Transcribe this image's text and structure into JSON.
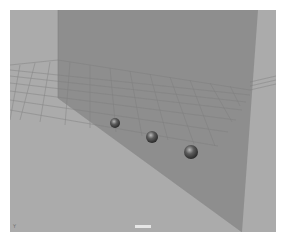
{
  "viewport": {
    "background_color": "#a9a9a9",
    "wall_color": "#8f8f8f",
    "floor_color": "#9f9f9f",
    "grid_color": "#7a7a7a",
    "camera_label": "persp",
    "axis_label": "Y"
  },
  "objects": [
    {
      "type": "sphere",
      "name": "sphere1",
      "x": 105,
      "y": 113,
      "r": 5
    },
    {
      "type": "sphere",
      "name": "sphere2",
      "x": 142,
      "y": 127,
      "r": 6
    },
    {
      "type": "sphere",
      "name": "sphere3",
      "x": 181,
      "y": 142,
      "r": 7
    }
  ]
}
